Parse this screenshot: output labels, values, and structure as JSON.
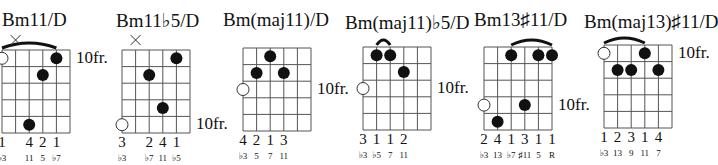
{
  "chords": [
    {
      "name": "Bm11/D",
      "title_x": 2,
      "title_y": 9,
      "grid_x": 2,
      "grid_y": 50,
      "fret_label": "10fr.",
      "fret_label_row": 0,
      "muted": [
        1
      ],
      "open_circles": [
        {
          "string": 0,
          "row": 0
        }
      ],
      "dots": [
        {
          "string": 4,
          "row": 0
        },
        {
          "string": 3,
          "row": 1
        },
        {
          "string": 2,
          "row": 4
        }
      ],
      "barre": {
        "from": 0,
        "to": 4
      },
      "fingers": [
        {
          "string": 0,
          "label": "1"
        },
        {
          "string": 2,
          "label": "4"
        },
        {
          "string": 3,
          "label": "2"
        },
        {
          "string": 4,
          "label": "1"
        }
      ],
      "intervals": [
        {
          "string": 0,
          "label": "♭3"
        },
        {
          "string": 2,
          "label": "11"
        },
        {
          "string": 3,
          "label": "5"
        },
        {
          "string": 4,
          "label": "♭7"
        }
      ]
    },
    {
      "name": "Bm11♭5/D",
      "title_x": 116,
      "title_y": 9,
      "grid_x": 122,
      "grid_y": 50,
      "fret_label": "10fr.",
      "fret_label_row": 4,
      "muted": [
        1
      ],
      "open_circles": [
        {
          "string": 0,
          "row": 4
        }
      ],
      "dots": [
        {
          "string": 4,
          "row": 0
        },
        {
          "string": 2,
          "row": 1
        },
        {
          "string": 3,
          "row": 3
        }
      ],
      "barre": null,
      "fingers": [
        {
          "string": 0,
          "label": "3"
        },
        {
          "string": 2,
          "label": "2"
        },
        {
          "string": 3,
          "label": "4"
        },
        {
          "string": 4,
          "label": "1"
        }
      ],
      "intervals": [
        {
          "string": 0,
          "label": "♭3"
        },
        {
          "string": 2,
          "label": "♭7"
        },
        {
          "string": 3,
          "label": "11"
        },
        {
          "string": 4,
          "label": "♭5"
        }
      ]
    },
    {
      "name": "Bm(maj11)/D",
      "title_x": 223,
      "title_y": 9,
      "grid_x": 243,
      "grid_y": 48,
      "fret_label": "10fr.",
      "fret_label_row": 2,
      "muted": [],
      "open_circles": [
        {
          "string": 0,
          "row": 2
        }
      ],
      "dots": [
        {
          "string": 2,
          "row": 0
        },
        {
          "string": 1,
          "row": 1
        },
        {
          "string": 3,
          "row": 1
        }
      ],
      "barre": null,
      "fingers": [
        {
          "string": 0,
          "label": "4"
        },
        {
          "string": 1,
          "label": "2"
        },
        {
          "string": 2,
          "label": "1"
        },
        {
          "string": 3,
          "label": "3"
        }
      ],
      "intervals": [
        {
          "string": 0,
          "label": "♭3"
        },
        {
          "string": 1,
          "label": "5"
        },
        {
          "string": 2,
          "label": "7"
        },
        {
          "string": 3,
          "label": "11"
        }
      ]
    },
    {
      "name": "Bm(maj11)♭5/D",
      "title_x": 345,
      "title_y": 11,
      "grid_x": 363,
      "grid_y": 47,
      "fret_label": "10fr.",
      "fret_label_row": 2,
      "muted": [],
      "open_circles": [
        {
          "string": 0,
          "row": 2
        }
      ],
      "dots": [
        {
          "string": 1,
          "row": 0
        },
        {
          "string": 2,
          "row": 0
        },
        {
          "string": 3,
          "row": 1
        }
      ],
      "barre": {
        "from": 1,
        "to": 2
      },
      "fingers": [
        {
          "string": 0,
          "label": "3"
        },
        {
          "string": 1,
          "label": "1"
        },
        {
          "string": 2,
          "label": "1"
        },
        {
          "string": 3,
          "label": "2"
        }
      ],
      "intervals": [
        {
          "string": 0,
          "label": "♭3"
        },
        {
          "string": 1,
          "label": "♭5"
        },
        {
          "string": 2,
          "label": "7"
        },
        {
          "string": 3,
          "label": "11"
        }
      ]
    },
    {
      "name": "Bm13♯11/D",
      "title_x": 474,
      "title_y": 9,
      "grid_x": 484,
      "grid_y": 47,
      "fret_label": "10fr.",
      "fret_label_row": 3,
      "muted": [],
      "open_circles": [
        {
          "string": 0,
          "row": 3
        }
      ],
      "dots": [
        {
          "string": 2,
          "row": 0
        },
        {
          "string": 4,
          "row": 0
        },
        {
          "string": 5,
          "row": 0
        },
        {
          "string": 3,
          "row": 3
        },
        {
          "string": 1,
          "row": 4
        }
      ],
      "barre": {
        "from": 2,
        "to": 5
      },
      "fingers": [
        {
          "string": 0,
          "label": "2"
        },
        {
          "string": 1,
          "label": "4"
        },
        {
          "string": 2,
          "label": "1"
        },
        {
          "string": 3,
          "label": "3"
        },
        {
          "string": 4,
          "label": "1"
        },
        {
          "string": 5,
          "label": "1"
        }
      ],
      "intervals": [
        {
          "string": 0,
          "label": "♭3"
        },
        {
          "string": 1,
          "label": "13"
        },
        {
          "string": 2,
          "label": "♭7"
        },
        {
          "string": 3,
          "label": "♯11"
        },
        {
          "string": 4,
          "label": "5"
        },
        {
          "string": 5,
          "label": "R"
        }
      ]
    },
    {
      "name": "Bm(maj13)♯11/D",
      "title_x": 584,
      "title_y": 11,
      "grid_x": 604,
      "grid_y": 45,
      "fret_label": "10fr.",
      "fret_label_row": 0,
      "muted": [],
      "open_circles": [
        {
          "string": 0,
          "row": 0
        }
      ],
      "dots": [
        {
          "string": 3,
          "row": 0
        },
        {
          "string": 1,
          "row": 1
        },
        {
          "string": 2,
          "row": 1
        },
        {
          "string": 4,
          "row": 1
        }
      ],
      "barre": {
        "from": 0,
        "to": 3
      },
      "fingers": [
        {
          "string": 0,
          "label": "1"
        },
        {
          "string": 1,
          "label": "2"
        },
        {
          "string": 2,
          "label": "3"
        },
        {
          "string": 3,
          "label": "1"
        },
        {
          "string": 4,
          "label": "4"
        }
      ],
      "intervals": [
        {
          "string": 0,
          "label": "♭3"
        },
        {
          "string": 1,
          "label": "13"
        },
        {
          "string": 2,
          "label": "9"
        },
        {
          "string": 3,
          "label": "11"
        },
        {
          "string": 4,
          "label": "7"
        }
      ]
    }
  ],
  "layout": {
    "string_spacing": 13.6,
    "fret_spacing": 16.6,
    "strings": 6,
    "frets": 5,
    "line_color": "#555555",
    "dot_color": "#111111"
  }
}
